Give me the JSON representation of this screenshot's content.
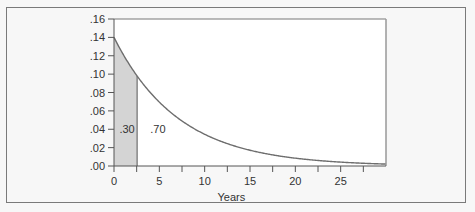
{
  "chart_data": {
    "type": "area",
    "title": "",
    "xlabel": "Years",
    "ylabel": "",
    "xlim": [
      0,
      30
    ],
    "ylim": [
      0,
      0.16
    ],
    "x_ticks": [
      0,
      5,
      10,
      15,
      20,
      25
    ],
    "x_tick_labels": [
      "0",
      "5",
      "10",
      "15",
      "20",
      "25"
    ],
    "x_minor_ticks": [
      2.5,
      7.5,
      12.5,
      17.5,
      22.5,
      27.5
    ],
    "y_ticks": [
      0,
      0.02,
      0.04,
      0.06,
      0.08,
      0.1,
      0.12,
      0.14,
      0.16
    ],
    "y_tick_labels": [
      ".00",
      ".02",
      ".04",
      ".06",
      ".08",
      ".10",
      ".12",
      ".14",
      ".16"
    ],
    "grid": false,
    "legend": null,
    "series": [
      {
        "name": "Exponential density",
        "function": "0.14 * exp(-0.14 * t)",
        "rate": 0.14,
        "x": [
          0,
          2.55,
          5,
          10,
          15,
          20,
          25,
          30
        ],
        "values": [
          0.14,
          0.098,
          0.07,
          0.035,
          0.017,
          0.0085,
          0.0042,
          0.0021
        ]
      }
    ],
    "shaded_region": {
      "x_from": 0,
      "x_to": 2.55,
      "color": "#d4d4d4"
    },
    "annotations": [
      {
        "text": ".30",
        "x": 0.6,
        "y": 0.04,
        "meaning": "area of shaded region"
      },
      {
        "text": ".70",
        "x": 4.0,
        "y": 0.04,
        "meaning": "area of unshaded region"
      }
    ]
  },
  "colors": {
    "curve": "#6e6e6e",
    "shade": "#d4d4d4",
    "axis": "#555555",
    "plot_bg": "#ffffff",
    "page_bg": "#f7f7f7"
  }
}
